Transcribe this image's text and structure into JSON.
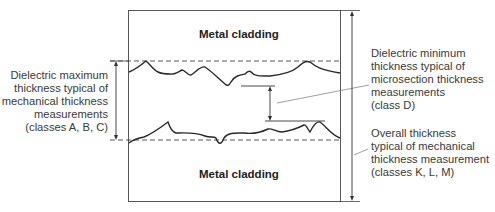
{
  "diagram": {
    "top_layer_label": "Metal cladding",
    "bottom_layer_label": "Metal cladding",
    "annotations": {
      "max_thickness": {
        "lines": [
          "Dielectric maximum",
          "thickness typical of",
          "mechanical thickness",
          "measurements",
          "(classes A, B, C)"
        ]
      },
      "min_thickness": {
        "lines": [
          "Dielectric minimum",
          "thickness typical of",
          "microsection thickness",
          "measurements",
          "(class D)"
        ]
      },
      "overall_thickness": {
        "lines": [
          "Overall thickness",
          "typical of mechanical",
          "thickness measurement",
          "(classes K, L, M)"
        ]
      }
    },
    "colors": {
      "line": "#2a2a2a",
      "leader": "#888888",
      "text": "#3a3a3a"
    }
  }
}
